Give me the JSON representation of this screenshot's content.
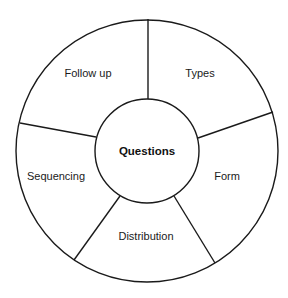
{
  "diagram": {
    "center": {
      "label": "Questions"
    },
    "segments": [
      {
        "label": "Types"
      },
      {
        "label": "Form"
      },
      {
        "label": "Distribution"
      },
      {
        "label": "Sequencing"
      },
      {
        "label": "Follow up"
      }
    ],
    "colors": {
      "stroke": "#1a1a1a",
      "background": "#ffffff"
    }
  }
}
